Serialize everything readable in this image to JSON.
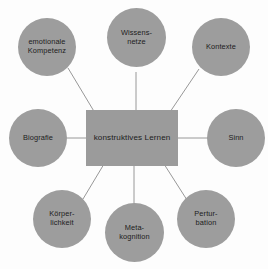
{
  "diagram": {
    "type": "concept-map",
    "title": "konstruktives Lernen",
    "layout": "radial hub-and-spoke",
    "background_color": "#fdfdfd",
    "node_fill_color": "#9d9d9d",
    "node_text_color": "#1c1c1c",
    "connector_color": "#8c8c8c",
    "hub": {
      "shape": "rectangle",
      "label": "konstruktives Lernen"
    },
    "nodes": [
      {
        "id": "emotionale-kompetenz",
        "shape": "circle",
        "label": "emotionale\nKompetenz",
        "position": "top-left"
      },
      {
        "id": "wissensnetze",
        "shape": "circle",
        "label": "Wissens-\nnetze",
        "position": "top-center"
      },
      {
        "id": "kontexte",
        "shape": "circle",
        "label": "Kontexte",
        "position": "top-right"
      },
      {
        "id": "biografie",
        "shape": "circle",
        "label": "Biografie",
        "position": "left"
      },
      {
        "id": "sinn",
        "shape": "circle",
        "label": "Sinn",
        "position": "right"
      },
      {
        "id": "koerperlichkeit",
        "shape": "circle",
        "label": "Körper-\nlichkeit",
        "position": "bottom-left"
      },
      {
        "id": "metakognition",
        "shape": "circle",
        "label": "Meta-\nkognition",
        "position": "bottom-center"
      },
      {
        "id": "perturbation",
        "shape": "circle",
        "label": "Pertur-\nbation",
        "position": "bottom-right"
      }
    ],
    "edges": [
      {
        "from": "konstruktives-lernen",
        "to": "emotionale-kompetenz"
      },
      {
        "from": "konstruktives-lernen",
        "to": "wissensnetze"
      },
      {
        "from": "konstruktives-lernen",
        "to": "kontexte"
      },
      {
        "from": "konstruktives-lernen",
        "to": "biografie"
      },
      {
        "from": "konstruktives-lernen",
        "to": "sinn"
      },
      {
        "from": "konstruktives-lernen",
        "to": "koerperlichkeit"
      },
      {
        "from": "konstruktives-lernen",
        "to": "metakognition"
      },
      {
        "from": "konstruktives-lernen",
        "to": "perturbation"
      }
    ]
  }
}
